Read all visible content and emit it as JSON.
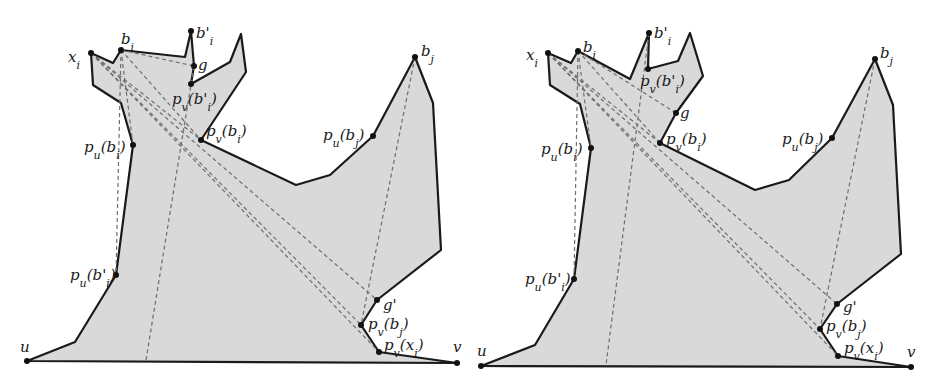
{
  "figure": {
    "panels": [
      {
        "id": "left",
        "polygon": "27,361 75,342 116,275 133,145 121,103 93,85 91,53 113,63 121,50 185,57 191,31 194,66 191,84 230,62 241,34 246,72 201,140 296,185 330,175 373,136 415,57 433,103 441,250 377,300 361,325 379,352 457,363",
        "dashed": [
          [
            91,
            53,
            379,
            352
          ],
          [
            91,
            53,
            361,
            325
          ],
          [
            91,
            53,
            201,
            140
          ],
          [
            91,
            53,
            377,
            300
          ],
          [
            121,
            50,
            194,
            66
          ],
          [
            121,
            50,
            201,
            140
          ],
          [
            121,
            50,
            133,
            145
          ],
          [
            121,
            50,
            116,
            275
          ],
          [
            194,
            66,
            146,
            360
          ],
          [
            415,
            57,
            361,
            325
          ]
        ],
        "points": [
          {
            "x": 27,
            "y": 361,
            "label": "u",
            "lx": 20,
            "ly": 352
          },
          {
            "x": 457,
            "y": 363,
            "label": "v",
            "lx": 453,
            "ly": 352
          },
          {
            "x": 91,
            "y": 53,
            "label": "x_i",
            "lx": 68,
            "ly": 62
          },
          {
            "x": 121,
            "y": 50,
            "label": "b_i",
            "lx": 121,
            "ly": 44
          },
          {
            "x": 191,
            "y": 31,
            "label": "b'_i",
            "lx": 196,
            "ly": 38
          },
          {
            "x": 194,
            "y": 66,
            "label": "g",
            "lx": 198,
            "ly": 70
          },
          {
            "x": 191,
            "y": 84,
            "label": "p_v(b'_i)",
            "lx": 172,
            "ly": 104
          },
          {
            "x": 201,
            "y": 140,
            "label": "p_v(b_i)",
            "lx": 206,
            "ly": 136
          },
          {
            "x": 133,
            "y": 145,
            "label": "p_u(b_i)",
            "lx": 84,
            "ly": 152
          },
          {
            "x": 116,
            "y": 275,
            "label": "p_u(b'_i)",
            "lx": 70,
            "ly": 280
          },
          {
            "x": 415,
            "y": 57,
            "label": "b_j",
            "lx": 421,
            "ly": 56
          },
          {
            "x": 373,
            "y": 136,
            "label": "p_u(b_j)",
            "lx": 323,
            "ly": 140
          },
          {
            "x": 377,
            "y": 300,
            "label": "g'",
            "lx": 383,
            "ly": 310
          },
          {
            "x": 361,
            "y": 325,
            "label": "p_v(b_j)",
            "lx": 368,
            "ly": 329
          },
          {
            "x": 379,
            "y": 352,
            "label": "p_v(x_i)",
            "lx": 384,
            "ly": 350
          }
        ]
      },
      {
        "id": "right",
        "polygon": "481,366 535,345 574,279 591,148 580,104 550,85 548,53 571,63 578,51 630,79 649,33 648,69 678,61 690,33 703,76 676,113 660,143 755,190 789,180 832,138 875,59 893,105 901,254 837,304 820,329 838,356 911,367",
        "dashed": [
          [
            548,
            53,
            838,
            356
          ],
          [
            548,
            53,
            820,
            329
          ],
          [
            548,
            53,
            660,
            143
          ],
          [
            548,
            53,
            837,
            304
          ],
          [
            578,
            51,
            660,
            143
          ],
          [
            578,
            51,
            591,
            148
          ],
          [
            578,
            51,
            574,
            279
          ],
          [
            578,
            51,
            676,
            113
          ],
          [
            649,
            33,
            606,
            365
          ],
          [
            875,
            59,
            820,
            329
          ]
        ],
        "points": [
          {
            "x": 481,
            "y": 366,
            "label": "u",
            "lx": 477,
            "ly": 356
          },
          {
            "x": 911,
            "y": 367,
            "label": "v",
            "lx": 907,
            "ly": 357
          },
          {
            "x": 548,
            "y": 53,
            "label": "x_i",
            "lx": 526,
            "ly": 60
          },
          {
            "x": 578,
            "y": 51,
            "label": "b_i",
            "lx": 583,
            "ly": 52
          },
          {
            "x": 649,
            "y": 33,
            "label": "b'_i",
            "lx": 654,
            "ly": 38
          },
          {
            "x": 648,
            "y": 69,
            "label": "p_v(b'_i)",
            "lx": 640,
            "ly": 86
          },
          {
            "x": 676,
            "y": 113,
            "label": "g",
            "lx": 680,
            "ly": 118
          },
          {
            "x": 660,
            "y": 143,
            "label": "p_v(b_i)",
            "lx": 666,
            "ly": 144
          },
          {
            "x": 591,
            "y": 148,
            "label": "p_u(b_i)",
            "lx": 541,
            "ly": 154
          },
          {
            "x": 574,
            "y": 279,
            "label": "p_u(b'_i)",
            "lx": 525,
            "ly": 284
          },
          {
            "x": 875,
            "y": 59,
            "label": "b_j",
            "lx": 880,
            "ly": 58
          },
          {
            "x": 832,
            "y": 138,
            "label": "p_u(b_j)",
            "lx": 782,
            "ly": 144
          },
          {
            "x": 837,
            "y": 304,
            "label": "g'",
            "lx": 843,
            "ly": 312
          },
          {
            "x": 820,
            "y": 329,
            "label": "p_v(b_j)",
            "lx": 826,
            "ly": 331
          },
          {
            "x": 838,
            "y": 356,
            "label": "p_v(x_i)",
            "lx": 844,
            "ly": 353
          }
        ]
      }
    ],
    "colors": {
      "fill": "#d9d9d9",
      "stroke": "#1a1a1a",
      "dashed": "#6e6e6e"
    }
  }
}
